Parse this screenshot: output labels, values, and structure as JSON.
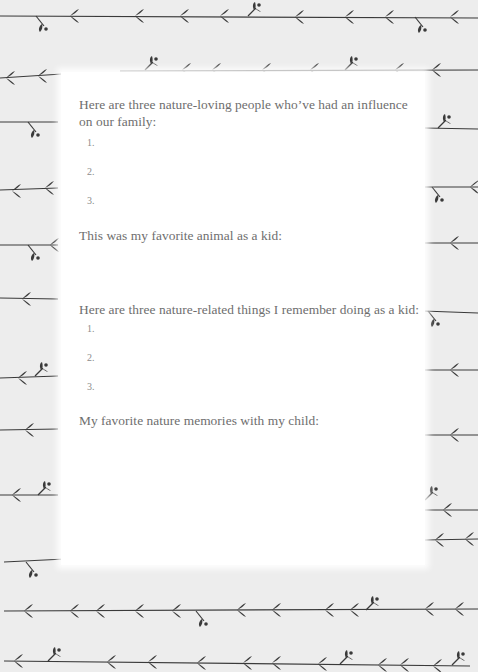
{
  "page": {
    "background_color": "#ededed",
    "panel_color": "#ffffff",
    "vine_color": "#3a3a3a",
    "text_color": "#6e6e6e",
    "decoration": "leafy-vine-border-icon"
  },
  "sections": [
    {
      "prompt_line1": "Here are three nature-loving people who’ve had an influence",
      "prompt_line2": "on our family:",
      "items": [
        "1.",
        "2.",
        "3."
      ]
    },
    {
      "prompt_line1": "This was my favorite animal as a kid:"
    },
    {
      "prompt_line1": "Here are three nature-related things I remember doing as a kid:",
      "items": [
        "1.",
        "2.",
        "3."
      ]
    },
    {
      "prompt_line1": "My favorite nature memories with my child:"
    }
  ]
}
